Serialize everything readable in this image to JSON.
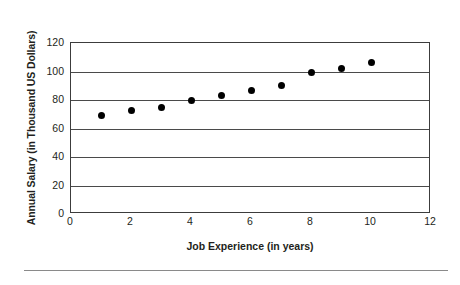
{
  "chart_data": {
    "type": "scatter",
    "title": "",
    "xlabel": "Job Experience (in years)",
    "ylabel": "Annual Salary (in Thousand US Dollars)",
    "xlim": [
      0,
      12
    ],
    "ylim": [
      0,
      120
    ],
    "xticks": [
      0,
      2,
      4,
      6,
      8,
      10,
      12
    ],
    "yticks": [
      0,
      20,
      40,
      60,
      80,
      100,
      120
    ],
    "xtick_labels": [
      "0",
      "2",
      "4",
      "6",
      "8",
      "10",
      "12"
    ],
    "ytick_labels": [
      "0",
      "20",
      "40",
      "60",
      "80",
      "100",
      "120"
    ],
    "grid": "horizontal",
    "legend": null,
    "series": [
      {
        "name": "Salary vs experience",
        "marker": "filled-circle",
        "color": "#000000",
        "x": [
          1,
          2,
          3,
          4,
          5,
          6,
          7,
          8,
          9,
          10
        ],
        "y": [
          69,
          72.5,
          75,
          80,
          83.5,
          86.5,
          90,
          99.5,
          102,
          106
        ],
        "points": [
          {
            "x": 1,
            "y": 69
          },
          {
            "x": 2,
            "y": 72.5
          },
          {
            "x": 3,
            "y": 75
          },
          {
            "x": 4,
            "y": 80
          },
          {
            "x": 5,
            "y": 83.5
          },
          {
            "x": 6,
            "y": 86.5
          },
          {
            "x": 7,
            "y": 90
          },
          {
            "x": 8,
            "y": 99.5
          },
          {
            "x": 9,
            "y": 102
          },
          {
            "x": 10,
            "y": 106
          }
        ]
      }
    ],
    "colors": {
      "marker": "#000000",
      "axis": "#3c3c3c",
      "gridline": "#4a4a4a",
      "text": "#231f20",
      "background": "#ffffff"
    }
  }
}
